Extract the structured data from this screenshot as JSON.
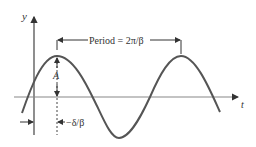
{
  "diagram": {
    "type": "sinusoid-annotated",
    "axes": {
      "y_label": "y",
      "x_label": "t"
    },
    "annotations": {
      "period": "Period = 2π/β",
      "amplitude": "A",
      "phase": "−δ/β"
    },
    "colors": {
      "curve": "#555555",
      "axes": "#444444",
      "text": "#333333"
    }
  }
}
